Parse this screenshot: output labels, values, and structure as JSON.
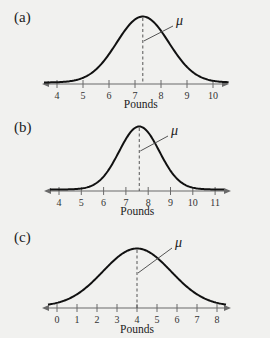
{
  "chart_data": [
    {
      "type": "line",
      "panel": "(a)",
      "title": "(a)",
      "xlabel": "Pounds",
      "ylabel": "",
      "x_ticks": [
        4,
        5,
        6,
        7,
        8,
        9,
        10
      ],
      "xlim": [
        3.4,
        10.6
      ],
      "curve": "normal",
      "mean": 7.3,
      "std": 1.0,
      "annotations": [
        {
          "text": "μ",
          "points_to": "mean"
        }
      ],
      "grid": false
    },
    {
      "type": "line",
      "panel": "(b)",
      "title": "(b)",
      "xlabel": "Pounds",
      "ylabel": "",
      "x_ticks": [
        4,
        5,
        6,
        7,
        8,
        9,
        10,
        11
      ],
      "xlim": [
        3.4,
        11.7
      ],
      "curve": "normal",
      "mean": 7.6,
      "std": 0.9,
      "annotations": [
        {
          "text": "μ",
          "points_to": "mean"
        }
      ],
      "grid": false
    },
    {
      "type": "line",
      "panel": "(c)",
      "title": "(c)",
      "xlabel": "Pounds",
      "ylabel": "",
      "x_ticks": [
        0,
        1,
        2,
        3,
        4,
        5,
        6,
        7,
        8
      ],
      "xlim": [
        -0.6,
        8.7
      ],
      "curve": "normal",
      "mean": 4.0,
      "std": 1.7,
      "annotations": [
        {
          "text": "μ",
          "points_to": "mean"
        }
      ],
      "grid": false
    }
  ],
  "panels": [
    {
      "label": "(a)",
      "xlabel": "Pounds",
      "mu": "μ"
    },
    {
      "label": "(b)",
      "xlabel": "Pounds",
      "mu": "μ"
    },
    {
      "label": "(c)",
      "xlabel": "Pounds",
      "mu": "μ"
    }
  ],
  "layout": [
    {
      "axis_y": 84,
      "peak_y": 17,
      "x0": 57,
      "tick0": 4,
      "spacing": 26,
      "axis_start": 42,
      "axis_end": 229,
      "curve_from": 3.5,
      "curve_to": 10.6,
      "mu_xy": [
        176,
        24
      ],
      "leader_from_y": 41,
      "label_y": 18,
      "xlabel_y": 108
    },
    {
      "axis_y": 191,
      "peak_y": 127,
      "x0": 59,
      "tick0": 4,
      "spacing": 22.3,
      "axis_start": 44,
      "axis_end": 231,
      "curve_from": 3.6,
      "curve_to": 11.4,
      "mu_xy": [
        171,
        134
      ],
      "leader_from_y": 151,
      "label_y": 128,
      "xlabel_y": 215
    },
    {
      "axis_y": 308,
      "peak_y": 249,
      "x0": 57,
      "tick0": 0,
      "spacing": 20,
      "axis_start": 42,
      "axis_end": 231,
      "curve_from": -0.45,
      "curve_to": 8.45,
      "mu_xy": [
        175,
        246
      ],
      "leader_from_y": 273,
      "label_y": 238,
      "xlabel_y": 333
    }
  ],
  "colors": {
    "background": "#f1f1ef",
    "curve": "#111111",
    "axis": "#6a6a6a",
    "text": "#222222"
  }
}
